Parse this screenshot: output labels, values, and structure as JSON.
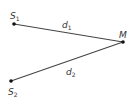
{
  "points": {
    "s1": {
      "label": "S",
      "sub": "1"
    },
    "s2": {
      "label": "S",
      "sub": "2"
    },
    "m": {
      "label": "M"
    }
  },
  "segments": {
    "d1": {
      "label": "d",
      "sub": "1"
    },
    "d2": {
      "label": "d",
      "sub": "2"
    }
  },
  "colors": {
    "line": "#333333",
    "point": "#111111"
  }
}
